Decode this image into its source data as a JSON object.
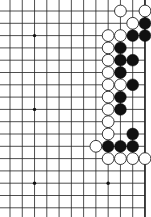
{
  "board": {
    "width": 151,
    "height": 217,
    "background": "#ffffff",
    "line_color": "#222222",
    "edge_color": "#111111",
    "columns": 12,
    "rows": 17,
    "col_origin": 10,
    "col_spacing": 12.27,
    "row_origin": 11,
    "row_spacing": 12.3,
    "right_edge_visible": true,
    "stone_radius": 5.9,
    "star_points": [
      [
        2,
        2
      ],
      [
        8,
        2
      ],
      [
        2,
        8
      ],
      [
        8,
        8
      ],
      [
        2,
        14
      ],
      [
        8,
        14
      ]
    ],
    "stones": {
      "white": [
        [
          9,
          0
        ],
        [
          11,
          0
        ],
        [
          10,
          1
        ],
        [
          8,
          2
        ],
        [
          9,
          2
        ],
        [
          8,
          3
        ],
        [
          8,
          4
        ],
        [
          8,
          5
        ],
        [
          8,
          6
        ],
        [
          9,
          6
        ],
        [
          8,
          7
        ],
        [
          8,
          8
        ],
        [
          8,
          9
        ],
        [
          8,
          10
        ],
        [
          7,
          11
        ],
        [
          8,
          12
        ],
        [
          9,
          12
        ],
        [
          10,
          12
        ],
        [
          11,
          12
        ]
      ],
      "black": [
        [
          11,
          1
        ],
        [
          10,
          2
        ],
        [
          11,
          2
        ],
        [
          9,
          3
        ],
        [
          9,
          4
        ],
        [
          10,
          4
        ],
        [
          9,
          5
        ],
        [
          10,
          6
        ],
        [
          9,
          7
        ],
        [
          9,
          8
        ],
        [
          10,
          10
        ],
        [
          8,
          11
        ],
        [
          9,
          11
        ],
        [
          10,
          11
        ]
      ]
    },
    "colors": {
      "white_stone_fill": "#ffffff",
      "white_stone_stroke": "#222222",
      "black_stone_fill": "#111111"
    }
  }
}
